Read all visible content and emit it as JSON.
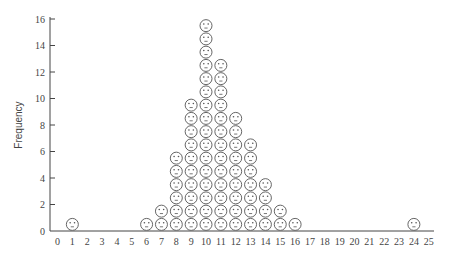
{
  "chart_data": {
    "type": "scatter",
    "subtype": "pictogram-dot-plot",
    "title": "",
    "xlabel": "",
    "ylabel": "Frequency",
    "xlim": [
      0,
      25
    ],
    "ylim": [
      0,
      16
    ],
    "x_ticks": [
      0,
      1,
      2,
      3,
      4,
      5,
      6,
      7,
      8,
      9,
      10,
      11,
      12,
      13,
      14,
      15,
      16,
      17,
      18,
      19,
      20,
      21,
      22,
      23,
      24,
      25
    ],
    "y_ticks": [
      0,
      2,
      4,
      6,
      8,
      10,
      12,
      14,
      16
    ],
    "grid": false,
    "legend": null,
    "marker": "smiley-face-icon",
    "x": [
      1,
      6,
      7,
      8,
      9,
      10,
      11,
      12,
      13,
      14,
      15,
      16,
      24
    ],
    "values": [
      1,
      1,
      2,
      6,
      10,
      16,
      13,
      9,
      7,
      4,
      2,
      1,
      1
    ]
  }
}
